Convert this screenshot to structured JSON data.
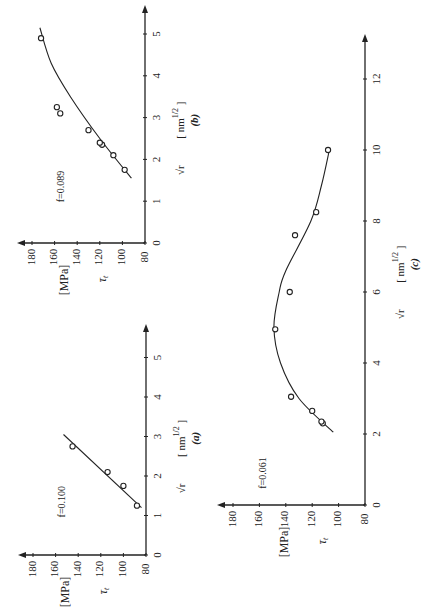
{
  "figure": {
    "orientation": "rotated 90 degrees counterclockwise",
    "y_axis_label": "τ_t",
    "y_axis_unit": "[MPa]",
    "x_axis_label": "√r",
    "x_axis_unit": "[ nm^1/2 ]",
    "line_color": "#222222"
  },
  "chart_data": [
    {
      "type": "scatter",
      "panel": "(a)",
      "annotation": "f = 0.100",
      "xlabel": "√r [nm^1/2]",
      "ylabel": "τ_t [MPa]",
      "xlim": [
        0,
        5
      ],
      "ylim": [
        80,
        180
      ],
      "x_ticks": [
        0,
        1,
        2,
        3,
        4,
        5
      ],
      "y_ticks": [
        80,
        100,
        120,
        140,
        160,
        180
      ],
      "grid": false,
      "points": [
        {
          "x": 1.25,
          "y": 88
        },
        {
          "x": 1.75,
          "y": 100
        },
        {
          "x": 2.1,
          "y": 114
        },
        {
          "x": 2.75,
          "y": 145
        }
      ],
      "fit": {
        "kind": "linear",
        "curve": [
          {
            "x": 1.2,
            "y": 84
          },
          {
            "x": 3.05,
            "y": 153
          }
        ]
      }
    },
    {
      "type": "scatter",
      "panel": "(b)",
      "annotation": "f = 0.089",
      "xlabel": "√r [nm^1/2]",
      "ylabel": "τ_t [MPa]",
      "xlim": [
        0,
        5
      ],
      "ylim": [
        80,
        180
      ],
      "x_ticks": [
        0,
        1,
        2,
        3,
        4,
        5
      ],
      "y_ticks": [
        80,
        100,
        120,
        140,
        160,
        180
      ],
      "grid": false,
      "points": [
        {
          "x": 1.75,
          "y": 98
        },
        {
          "x": 2.1,
          "y": 108
        },
        {
          "x": 2.35,
          "y": 118
        },
        {
          "x": 2.4,
          "y": 120
        },
        {
          "x": 2.7,
          "y": 130
        },
        {
          "x": 3.1,
          "y": 155
        },
        {
          "x": 3.25,
          "y": 158
        },
        {
          "x": 4.9,
          "y": 172
        }
      ],
      "fit": {
        "kind": "smooth",
        "curve": [
          {
            "x": 1.55,
            "y": 92
          },
          {
            "x": 2.5,
            "y": 120
          },
          {
            "x": 3.5,
            "y": 146
          },
          {
            "x": 4.3,
            "y": 163
          },
          {
            "x": 5.15,
            "y": 173
          }
        ]
      }
    },
    {
      "type": "scatter",
      "panel": "(c)",
      "annotation": "f = 0.061",
      "xlabel": "√r [nm^1/2]",
      "ylabel": "τ_t [MPa]",
      "xlim": [
        0,
        13
      ],
      "ylim": [
        80,
        180
      ],
      "x_ticks": [
        0,
        2,
        4,
        6,
        8,
        10,
        12
      ],
      "y_ticks": [
        80,
        100,
        120,
        140,
        160,
        180
      ],
      "grid": false,
      "points": [
        {
          "x": 2.3,
          "y": 112
        },
        {
          "x": 2.35,
          "y": 113
        },
        {
          "x": 2.65,
          "y": 120
        },
        {
          "x": 3.05,
          "y": 136
        },
        {
          "x": 4.95,
          "y": 148
        },
        {
          "x": 6.0,
          "y": 137
        },
        {
          "x": 7.6,
          "y": 133
        },
        {
          "x": 8.25,
          "y": 117
        },
        {
          "x": 10.0,
          "y": 108
        }
      ],
      "fit": {
        "kind": "smooth",
        "curve": [
          {
            "x": 2.05,
            "y": 104
          },
          {
            "x": 3.0,
            "y": 130
          },
          {
            "x": 4.0,
            "y": 144
          },
          {
            "x": 5.0,
            "y": 149
          },
          {
            "x": 6.0,
            "y": 145
          },
          {
            "x": 6.6,
            "y": 140
          },
          {
            "x": 8.0,
            "y": 121
          },
          {
            "x": 9.0,
            "y": 113
          },
          {
            "x": 10.0,
            "y": 107
          }
        ]
      }
    }
  ]
}
